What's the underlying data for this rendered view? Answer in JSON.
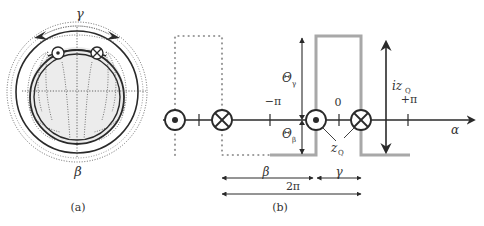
{
  "panel_a": {
    "caption": "(a)",
    "label_top": "γ",
    "label_bottom": "β",
    "symbols": [
      "dot-current-out",
      "cross-current-in"
    ]
  },
  "panel_b": {
    "caption": "(b)",
    "axis_label": "α",
    "ticks": {
      "neg_pi": "−π",
      "zero": "0",
      "pos_pi": "+π"
    },
    "theta_gamma": {
      "main": "Θ",
      "sub": "γ"
    },
    "theta_beta": {
      "main": "Θ",
      "sub": "β"
    },
    "iz_q": {
      "main": "iz",
      "sub": "Q"
    },
    "z_q": {
      "main": "z",
      "sub": "Q"
    },
    "dims": {
      "beta": "β",
      "gamma": "γ",
      "two_pi": "2π"
    }
  },
  "colors": {
    "ink": "#2a2a2a",
    "gray_waveform": "#a8a8a8",
    "dotted": "#9a9a9a"
  }
}
